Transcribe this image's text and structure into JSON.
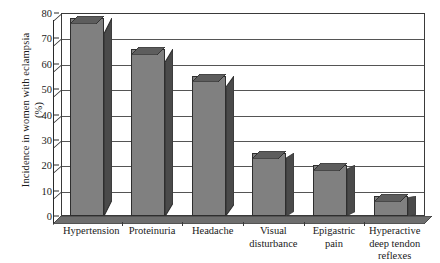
{
  "chart_data": {
    "type": "bar",
    "title": "",
    "xlabel": "",
    "ylabel": "Incidence in women with eclampsia (%)",
    "ylabel_lines": [
      "Incidence in women with eclampsia",
      "(%)"
    ],
    "categories": [
      "Hypertension",
      "Proteinuria",
      "Headache",
      "Visual disturbance",
      "Epigastric pain",
      "Hyperactive deep tendon reflexes"
    ],
    "category_lines": [
      [
        "Hypertension"
      ],
      [
        "Proteinuria"
      ],
      [
        "Headache"
      ],
      [
        "Visual",
        "disturbance"
      ],
      [
        "Epigastric",
        "pain"
      ],
      [
        "Hyperactive",
        "deep tendon",
        "reflexes"
      ]
    ],
    "values": [
      78,
      66,
      55,
      25,
      20,
      8
    ],
    "ylim": [
      0,
      80
    ],
    "ytick_values": [
      0,
      10,
      20,
      30,
      40,
      50,
      60,
      70,
      80
    ],
    "ytick_labels": [
      "0",
      "10",
      "20",
      "30",
      "40",
      "50",
      "60",
      "70",
      "80"
    ],
    "grid": true,
    "grid_axis": "y",
    "legend": false,
    "style": "3d-column",
    "colors": {
      "bar_front": "#808080",
      "bar_side": "#4a4a4a",
      "bar_top": "#5d5d5d",
      "bar_outline": "#2e2e2e",
      "gridline": "#555555",
      "axis": "#2a2a2a",
      "plot_background": "#ffffff",
      "floor": "#6e6e6e",
      "text": "#1a1a1a"
    }
  }
}
